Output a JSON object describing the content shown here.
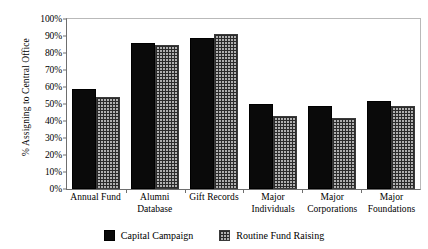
{
  "chart_data": {
    "type": "bar",
    "title": "",
    "xlabel": "",
    "ylabel": "% Assigning to Central Office",
    "ylim": [
      0,
      100
    ],
    "ytick_labels": [
      "100%",
      "90%",
      "80%",
      "70%",
      "60%",
      "50%",
      "40%",
      "30%",
      "20%",
      "10%",
      "0%"
    ],
    "ytick_values": [
      100,
      90,
      80,
      70,
      60,
      50,
      40,
      30,
      20,
      10,
      0
    ],
    "grid": false,
    "legend_position": "bottom",
    "categories": [
      "Annual Fund",
      "Alumni Database",
      "Gift Records",
      "Major Individuals",
      "Major Corporations",
      "Major Foundations"
    ],
    "series": [
      {
        "name": "Capital Campaign",
        "color": "#0a0a0a",
        "pattern": "solid",
        "values": [
          59,
          86,
          89,
          50,
          49,
          52
        ]
      },
      {
        "name": "Routine Fund Raising",
        "color": "#b0b0b0",
        "pattern": "crosshatch",
        "values": [
          54,
          85,
          91,
          43,
          42,
          49
        ]
      }
    ]
  },
  "legend": {
    "items": [
      {
        "label": "Capital Campaign"
      },
      {
        "label": "Routine Fund Raising"
      }
    ]
  }
}
